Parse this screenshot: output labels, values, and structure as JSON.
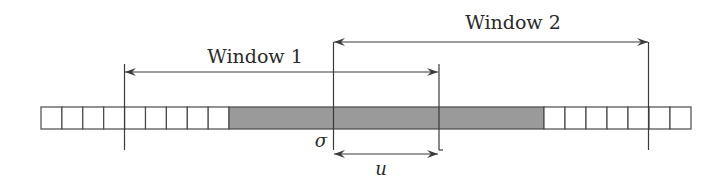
{
  "diagram": {
    "type": "sliding-window-strip",
    "labels": {
      "window1": "Window 1",
      "window2": "Window 2",
      "sigma": "σ",
      "u": "u"
    },
    "colors": {
      "line": "#3a3a3a",
      "cell_border": "#4a4a4a",
      "shaded_fill": "#9a9a9a",
      "cell_fill": "#ffffff",
      "background": "#ffffff"
    },
    "strip": {
      "left_white_cells": 9,
      "shaded_block": 1,
      "right_white_cells": 7
    },
    "arrows": [
      {
        "name": "window1-span",
        "label": "Window 1",
        "direction": "both"
      },
      {
        "name": "window2-span",
        "label": "Window 2",
        "direction": "both"
      },
      {
        "name": "u-offset",
        "label": "u",
        "direction": "both"
      }
    ],
    "markers": [
      {
        "name": "sigma-marker",
        "label": "σ"
      }
    ]
  }
}
